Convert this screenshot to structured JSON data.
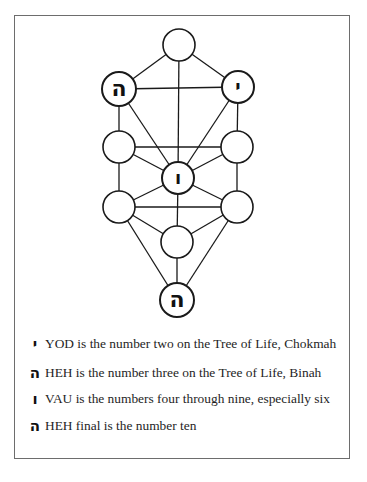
{
  "diagram": {
    "nodes": [
      {
        "id": "kether",
        "cx": 179,
        "cy": 45,
        "r": 16,
        "letter": ""
      },
      {
        "id": "binah",
        "cx": 119,
        "cy": 89,
        "r": 17,
        "letter": "ה"
      },
      {
        "id": "chokmah",
        "cx": 238,
        "cy": 87,
        "r": 16,
        "letter": "י"
      },
      {
        "id": "chesed",
        "cx": 237,
        "cy": 147,
        "r": 16,
        "letter": ""
      },
      {
        "id": "geburah",
        "cx": 119,
        "cy": 147,
        "r": 16,
        "letter": ""
      },
      {
        "id": "tiphareth",
        "cx": 178,
        "cy": 178,
        "r": 16,
        "letter": "ו"
      },
      {
        "id": "netzach",
        "cx": 237,
        "cy": 207,
        "r": 16,
        "letter": ""
      },
      {
        "id": "hod",
        "cx": 119,
        "cy": 207,
        "r": 16,
        "letter": ""
      },
      {
        "id": "yesod",
        "cx": 177,
        "cy": 242,
        "r": 16,
        "letter": ""
      },
      {
        "id": "malkuth",
        "cx": 177,
        "cy": 300,
        "r": 17,
        "letter": "ה"
      }
    ],
    "paths": [
      [
        "kether",
        "binah"
      ],
      [
        "kether",
        "chokmah"
      ],
      [
        "kether",
        "tiphareth"
      ],
      [
        "binah",
        "chokmah"
      ],
      [
        "binah",
        "geburah"
      ],
      [
        "binah",
        "tiphareth"
      ],
      [
        "chokmah",
        "chesed"
      ],
      [
        "chokmah",
        "tiphareth"
      ],
      [
        "geburah",
        "chesed"
      ],
      [
        "geburah",
        "tiphareth"
      ],
      [
        "geburah",
        "hod"
      ],
      [
        "chesed",
        "tiphareth"
      ],
      [
        "chesed",
        "netzach"
      ],
      [
        "tiphareth",
        "netzach"
      ],
      [
        "tiphareth",
        "hod"
      ],
      [
        "tiphareth",
        "yesod"
      ],
      [
        "hod",
        "netzach"
      ],
      [
        "hod",
        "yesod"
      ],
      [
        "hod",
        "malkuth"
      ],
      [
        "netzach",
        "yesod"
      ],
      [
        "netzach",
        "malkuth"
      ],
      [
        "yesod",
        "malkuth"
      ]
    ],
    "colors": {
      "stroke": "#1a1a1a",
      "frame": "#6d6d6d",
      "background": "#ffffff"
    }
  },
  "legend": {
    "items": [
      {
        "glyph": "י",
        "glyph_name": "yod",
        "text": "YOD is the number two on the Tree of Life, Chokmah"
      },
      {
        "glyph": "ה",
        "glyph_name": "heh",
        "text": "HEH is the number three on the Tree of Life, Binah"
      },
      {
        "glyph": "ו",
        "glyph_name": "vau",
        "text": "VAU is the numbers four through nine, especially six"
      },
      {
        "glyph": "ה",
        "glyph_name": "heh-final",
        "text": "HEH final is the number ten"
      }
    ]
  }
}
